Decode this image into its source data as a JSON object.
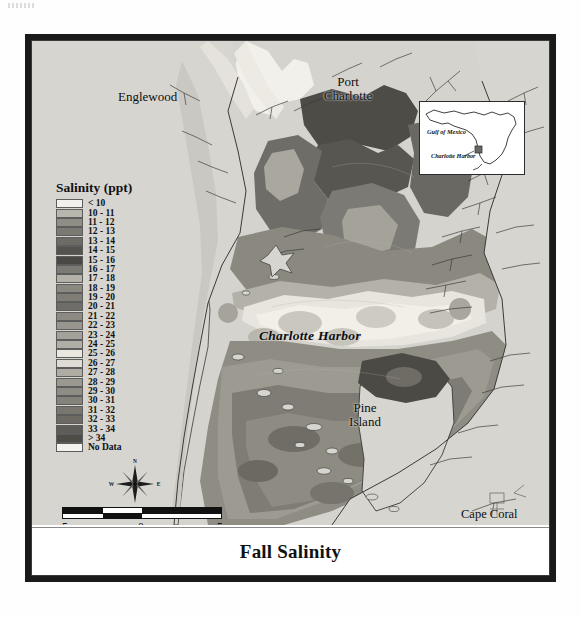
{
  "title": "Fall Salinity",
  "legend": {
    "title": "Salinity (ppt)",
    "items": [
      {
        "label": "< 10",
        "color": "#f2f0ea"
      },
      {
        "label": "10 - 11",
        "color": "#b9b7ad"
      },
      {
        "label": "11 - 12",
        "color": "#8f8d86"
      },
      {
        "label": "12 - 13",
        "color": "#7b7972"
      },
      {
        "label": "13 - 14",
        "color": "#6d6b65"
      },
      {
        "label": "14 - 15",
        "color": "#55534e"
      },
      {
        "label": "15 - 16",
        "color": "#4a4844"
      },
      {
        "label": "16 - 17",
        "color": "#7c7a74"
      },
      {
        "label": "17 - 18",
        "color": "#b3b1a8"
      },
      {
        "label": "18 - 19",
        "color": "#8a887f"
      },
      {
        "label": "19 - 20",
        "color": "#7f7d76"
      },
      {
        "label": "20 - 21",
        "color": "#6f6d67"
      },
      {
        "label": "21 - 22",
        "color": "#8b8982"
      },
      {
        "label": "22 - 23",
        "color": "#97958d"
      },
      {
        "label": "23 - 24",
        "color": "#a3a199"
      },
      {
        "label": "24 - 25",
        "color": "#b0aea5"
      },
      {
        "label": "25 - 26",
        "color": "#e9e7e0"
      },
      {
        "label": "26 - 27",
        "color": "#dedcd4"
      },
      {
        "label": "27 - 28",
        "color": "#aeaca3"
      },
      {
        "label": "28 - 29",
        "color": "#9b998f"
      },
      {
        "label": "29 - 30",
        "color": "#8e8c83"
      },
      {
        "label": "30 - 31",
        "color": "#84827a"
      },
      {
        "label": "31 - 32",
        "color": "#78766f"
      },
      {
        "label": "32 - 33",
        "color": "#6c6a63"
      },
      {
        "label": "33 - 34",
        "color": "#5e5c56"
      },
      {
        "label": "> 34",
        "color": "#4e4c47"
      },
      {
        "label": "No Data",
        "color": "#f4f2ec"
      }
    ]
  },
  "places": {
    "englewood": "Englewood",
    "port_charlotte": "Port\nCharlotte",
    "port_charlotte_line1": "Port",
    "port_charlotte_line2": "Charlotte",
    "charlotte_harbor": "Charlotte Harbor",
    "pine_island_line1": "Pine",
    "pine_island_line2": "Island",
    "cape_coral": "Cape Coral"
  },
  "inset": {
    "gulf_label": "Gulf of Mexico",
    "harbor_label": "Charlotte Harbor"
  },
  "scalebar": {
    "left_label": "5",
    "center_label": "0",
    "right_label": "5",
    "units": "Kilometers"
  },
  "north_arrow": {
    "n": "N",
    "s": "S",
    "e": "E",
    "w": "W"
  },
  "colors": {
    "land": "#d7d5cf",
    "water_nodata": "#f2f0ea",
    "frame": "#1a1a1a",
    "coastline": "#3a3a38"
  }
}
